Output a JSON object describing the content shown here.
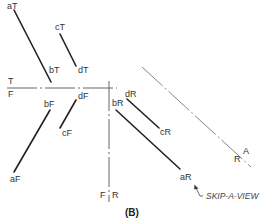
{
  "diagram": {
    "caption": "(B)",
    "note": "SKIP-A-VIEW",
    "fold_lines": {
      "tf": {
        "top_label": "T",
        "bottom_label": "F"
      },
      "fr": {
        "left_label": "F",
        "right_label": "R"
      },
      "ar": {
        "upper_label": "A",
        "lower_label": "R"
      }
    },
    "top_view": {
      "points": {
        "aT": "aT",
        "bT": "bT",
        "cT": "cT",
        "dT": "dT"
      }
    },
    "front_view": {
      "points": {
        "aF": "aF",
        "bF": "bF",
        "cF": "cF",
        "dF": "dF"
      }
    },
    "right_view": {
      "points": {
        "aR": "aR",
        "bR": "bR",
        "cR": "cR",
        "dR": "dR"
      }
    },
    "colors": {
      "object_line": "#222222",
      "fold_line": "#777777",
      "text": "#333333"
    }
  }
}
